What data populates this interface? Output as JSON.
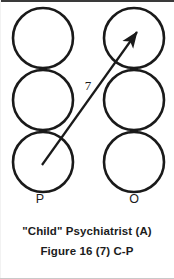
{
  "figure": {
    "type": "diagram",
    "columns": [
      {
        "label": "P",
        "label_x": 40,
        "label_y": 203,
        "circle_cx": 43
      },
      {
        "label": "O",
        "label_x": 134,
        "label_y": 203,
        "circle_cx": 134
      }
    ],
    "circle_radius": 30,
    "circle_stroke": "#1a1a1a",
    "circle_stroke_width": 2.6,
    "circle_fill": "none",
    "circles": [
      {
        "name": "left-top",
        "cx": 43,
        "cy": 38
      },
      {
        "name": "left-middle",
        "cx": 43,
        "cy": 100
      },
      {
        "name": "left-bottom",
        "cx": 43,
        "cy": 162
      },
      {
        "name": "right-top",
        "cx": 134,
        "cy": 38
      },
      {
        "name": "right-middle",
        "cx": 134,
        "cy": 100
      },
      {
        "name": "right-bottom",
        "cx": 134,
        "cy": 162
      }
    ],
    "arrow": {
      "name": "relation-arrow",
      "from_circle": "left-bottom",
      "to_circle": "right-top",
      "x1": 42,
      "y1": 165,
      "x2": 137,
      "y2": 32,
      "stroke": "#1a1a1a",
      "stroke_width": 2.2,
      "label": "7",
      "label_x": 88,
      "label_y": 90
    }
  },
  "caption": {
    "title": "\"Child\" Psychiatrist (A)",
    "figure_line": "Figure 16 (7) C-P"
  }
}
